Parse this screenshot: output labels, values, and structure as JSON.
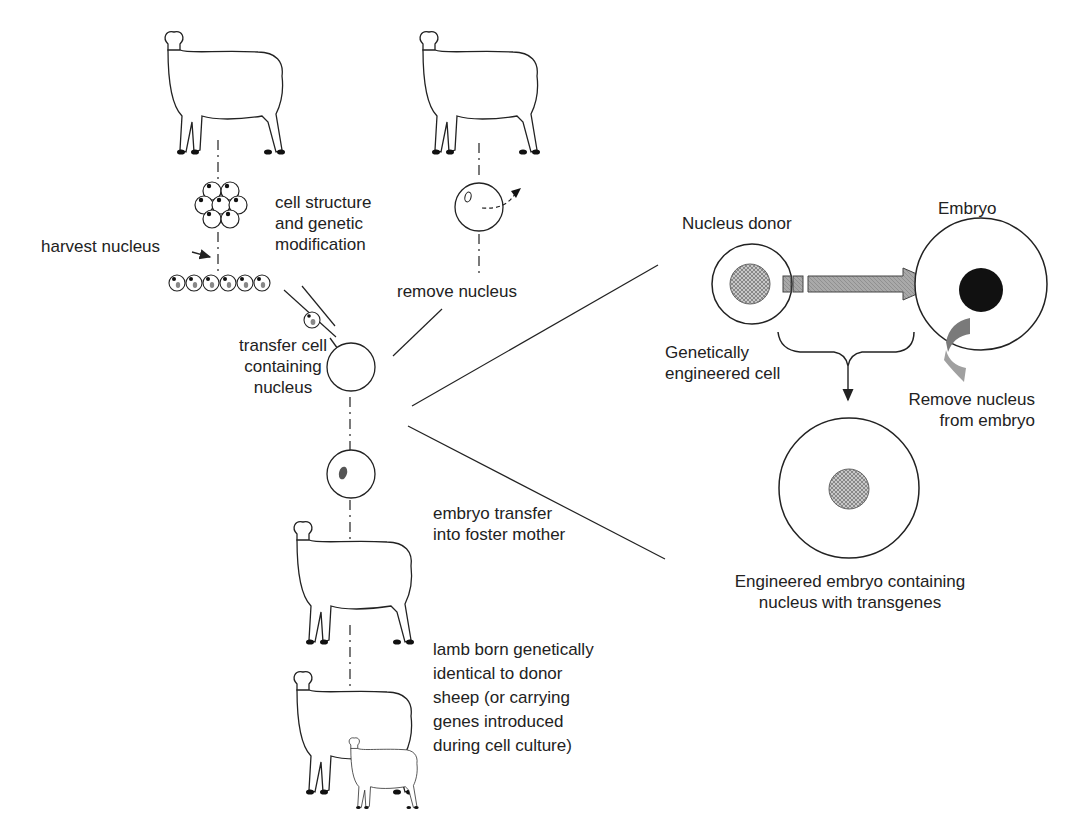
{
  "diagram": {
    "type": "process-flow",
    "left_flow": {
      "cell_culture_label": [
        "cell structure",
        "and genetic",
        "modification"
      ],
      "harvest_label": "harvest nucleus",
      "remove_label": "remove nucleus",
      "transfer_label": [
        "transfer cell",
        "containing",
        "nucleus"
      ],
      "embryo_transfer_label": [
        "embryo transfer",
        "into foster mother"
      ],
      "lamb_label": [
        "lamb born genetically",
        "identical to donor",
        "sheep (or carrying",
        "genes introduced",
        "during cell culture)"
      ]
    },
    "detail_panel": {
      "donor_title": "Nucleus donor",
      "embryo_title": "Embryo",
      "engineered_cell_label": [
        "Genetically",
        "engineered cell"
      ],
      "remove_embryo_nucleus_label": [
        "Remove nucleus",
        "from embryo"
      ],
      "result_label": [
        "Engineered embryo containing",
        "nucleus with transgenes"
      ]
    },
    "colors": {
      "line": "#222222",
      "arrow_fill": "#9a9a9a",
      "nucleus_hatched": "#a8a8a8",
      "embryo_nucleus": "#111111",
      "curved_arrow": "#8a8a8a"
    }
  }
}
